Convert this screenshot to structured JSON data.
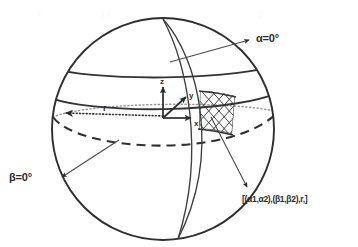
{
  "figure": {
    "background_color": "#ffffff",
    "ink_color": "#2b2b2b",
    "line_color": "#3a3a3a"
  },
  "labels": {
    "alpha_zero": "α=0°",
    "beta_zero": "β=0°",
    "patch": "[(α1,α2),(β1,β2),r,]",
    "axis_z": "z",
    "axis_y": "y",
    "axis_x": "x",
    "radius": "r"
  },
  "geometry": {
    "sphere": {
      "center_x": 163,
      "center_y": 129,
      "radius": 111
    },
    "north_pole": {
      "x": 163,
      "y": 19
    },
    "south_pole": {
      "x": 178,
      "y": 239
    },
    "origin": {
      "x": 163,
      "y": 118
    },
    "latitude_lines": [
      {
        "name": "latitude-upper",
        "center_y": 68
      },
      {
        "name": "latitude-lower",
        "center_y": 92
      }
    ],
    "equator": {
      "name": "equator-dashed",
      "center_y": 118,
      "style": "dashed"
    },
    "radius_line": {
      "name": "radius-dotted",
      "from_x": 163,
      "from_y": 118,
      "to_x": 62,
      "to_y": 113,
      "style": "dotted"
    },
    "meridians": [
      {
        "name": "meridian-alpha1"
      },
      {
        "name": "meridian-alpha2"
      }
    ],
    "patch_region": {
      "name": "hatched-patch",
      "hatch": "cross-hatch"
    },
    "axes": [
      {
        "name": "axis-z",
        "to_x": 163,
        "to_y": 85
      },
      {
        "name": "axis-y",
        "to_x": 187,
        "to_y": 96
      },
      {
        "name": "axis-x",
        "to_x": 192,
        "to_y": 118
      }
    ],
    "leaders": [
      {
        "name": "leader-alpha-zero",
        "from_x": 170,
        "from_y": 61,
        "to_x": 252,
        "to_y": 40
      },
      {
        "name": "leader-beta-zero",
        "from_x": 118,
        "from_y": 140,
        "to_x": 59,
        "to_y": 178
      },
      {
        "name": "leader-patch",
        "from_x": 212,
        "from_y": 118,
        "to_x": 249,
        "to_y": 189
      }
    ]
  }
}
